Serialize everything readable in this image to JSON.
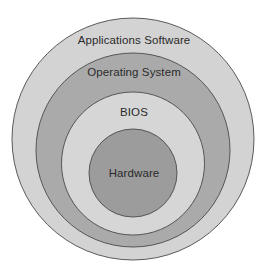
{
  "diagram": {
    "type": "concentric-layers",
    "layers": [
      {
        "label": "Applications Software",
        "fill": "#d3d3d3",
        "cx": 133,
        "cy": 139,
        "r": 121,
        "label_y": 33
      },
      {
        "label": "Operating System",
        "fill": "#aaaaaa",
        "cx": 133,
        "cy": 150,
        "r": 97,
        "label_y": 65
      },
      {
        "label": "BIOS",
        "fill": "#d6d6d6",
        "cx": 133,
        "cy": 163.5,
        "r": 71.5,
        "label_y": 105
      },
      {
        "label": "Hardware",
        "fill": "#9c9c9c",
        "cx": 133,
        "cy": 173,
        "r": 44,
        "label_y": 166
      }
    ],
    "stroke": "#4a4a4a"
  }
}
